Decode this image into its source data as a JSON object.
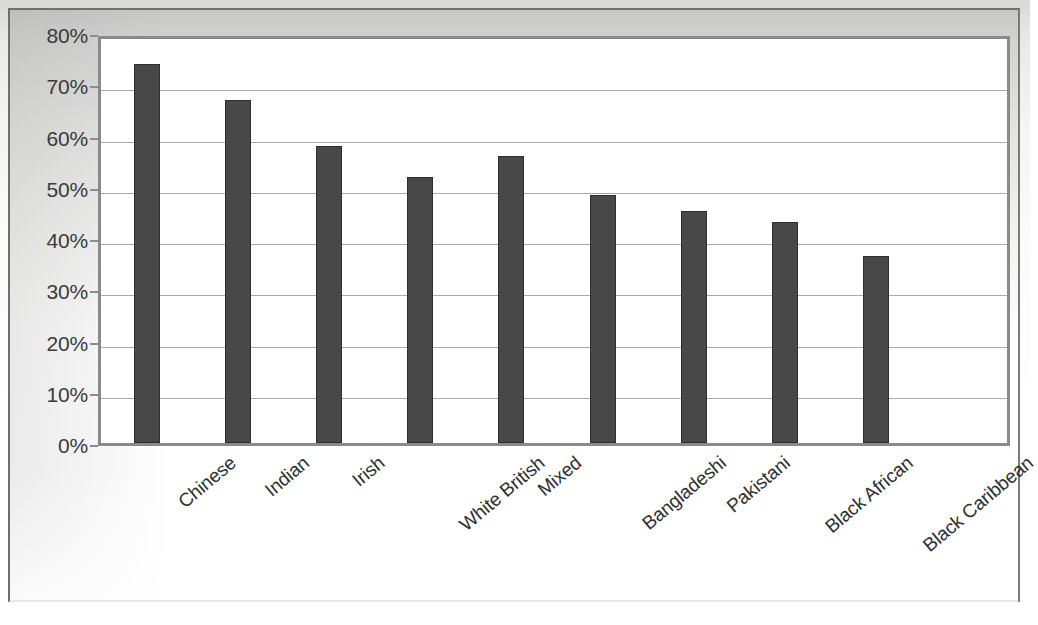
{
  "chart_data": {
    "type": "bar",
    "title": "",
    "subtitle": "",
    "xlabel": "",
    "ylabel": "",
    "categories": [
      "Chinese",
      "Indian",
      "Irish",
      "White British",
      "Mixed",
      "Bangladeshi",
      "Pakistani",
      "Black African",
      "Black Caribbean"
    ],
    "values": [
      74,
      67,
      58,
      52,
      56,
      48.4,
      45.3,
      43.1,
      36.5
    ],
    "value_suffix": "%",
    "ylim": [
      0,
      80
    ],
    "ytick_step": 10,
    "ytick_labels": [
      "0%",
      "10%",
      "20%",
      "30%",
      "40%",
      "50%",
      "60%",
      "70%",
      "80%"
    ],
    "ytick_values": [
      0,
      10,
      20,
      30,
      40,
      50,
      60,
      70,
      80
    ],
    "grid": true,
    "grid_axis": "y",
    "legend": false,
    "legend_position": "none",
    "bar_color": "#484848",
    "bar_border_color": "#2e2e2e",
    "plot_background": "#ffffff",
    "plot_border_color": "#8a8a8a",
    "gridline_color": "#a9a9a9",
    "axis_text_color": "#3b3b3b",
    "category_label_rotation": -40,
    "empty_trailing_slots": 1
  }
}
